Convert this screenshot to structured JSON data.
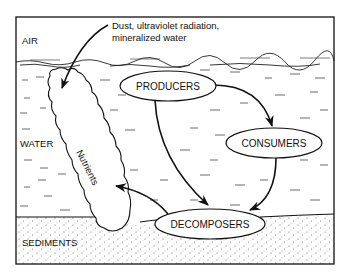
{
  "diagram": {
    "zones": {
      "air": "AIR",
      "water": "WATER",
      "sediments": "SEDIMENTS"
    },
    "annotation": {
      "line1": "Dust, ultraviolet radiation,",
      "line2": "mineralized water"
    },
    "nutrients_label": "Nutrients",
    "nodes": {
      "producers": "PRODUCERS",
      "consumers": "CONSUMERS",
      "decomposers": "DECOMPOSERS"
    },
    "edges": [
      {
        "from": "external inputs",
        "to": "Nutrients"
      },
      {
        "from": "PRODUCERS",
        "to": "CONSUMERS"
      },
      {
        "from": "PRODUCERS",
        "to": "DECOMPOSERS"
      },
      {
        "from": "CONSUMERS",
        "to": "DECOMPOSERS"
      },
      {
        "from": "DECOMPOSERS",
        "to": "Nutrients"
      }
    ],
    "colors": {
      "ink": "#111111",
      "background": "#ffffff",
      "sediment_dots": "#555555"
    }
  }
}
